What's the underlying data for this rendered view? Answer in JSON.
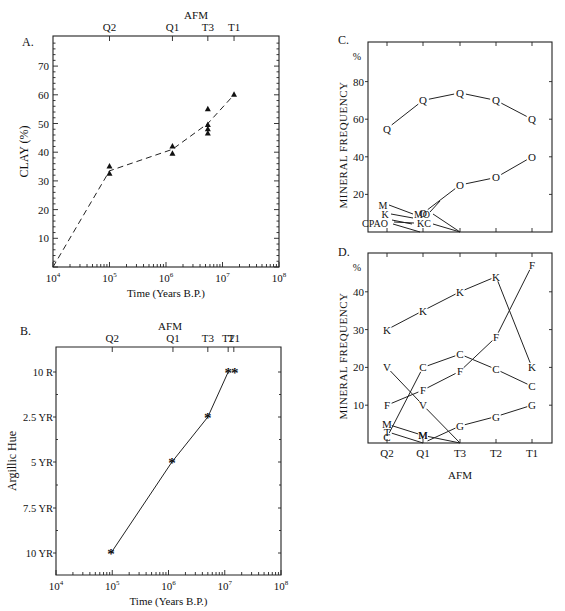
{
  "chart_data": [
    {
      "id": "A",
      "panel_label": "A.",
      "type": "scatter",
      "title": "",
      "top_axis_title": "AFM",
      "top_axis_ticks": [
        {
          "label": "Q2",
          "x": 100000
        },
        {
          "label": "Q1",
          "x": 1300000
        },
        {
          "label": "T3",
          "x": 5500000
        },
        {
          "label": "T1",
          "x": 16000000
        }
      ],
      "xlabel": "Time (Years B.P.)",
      "ylabel": "CLAY (%)",
      "xscale": "log",
      "xlim": [
        10000,
        100000000
      ],
      "ylim": [
        0,
        80
      ],
      "xticks": [
        "10^4",
        "10^5",
        "10^6",
        "10^7",
        "10^8"
      ],
      "yticks": [
        10,
        20,
        30,
        40,
        50,
        60,
        70
      ],
      "points_marker": "triangle",
      "points": [
        {
          "x": 100000,
          "y": 35
        },
        {
          "x": 100000,
          "y": 32.5
        },
        {
          "x": 1300000,
          "y": 42
        },
        {
          "x": 1300000,
          "y": 39.5
        },
        {
          "x": 5500000,
          "y": 55
        },
        {
          "x": 5500000,
          "y": 49.5
        },
        {
          "x": 5500000,
          "y": 48
        },
        {
          "x": 5500000,
          "y": 46.5
        },
        {
          "x": 16000000,
          "y": 60
        }
      ],
      "trend_line_style": "dashed",
      "trend_line": [
        {
          "x": 10000,
          "y": 0
        },
        {
          "x": 100000,
          "y": 33.5
        },
        {
          "x": 1300000,
          "y": 41
        },
        {
          "x": 5500000,
          "y": 50
        },
        {
          "x": 16000000,
          "y": 60
        }
      ]
    },
    {
      "id": "B",
      "panel_label": "B.",
      "type": "line",
      "title": "",
      "top_axis_title": "AFM",
      "top_axis_ticks": [
        {
          "label": "Q2",
          "x": 100000
        },
        {
          "label": "Q1",
          "x": 1200000
        },
        {
          "label": "T3",
          "x": 5000000
        },
        {
          "label": "T2",
          "x": 11500000
        },
        {
          "label": "T1",
          "x": 14500000
        }
      ],
      "xlabel": "Time (Years B.P.)",
      "ylabel": "Argillic Hue",
      "xscale": "log",
      "xlim": [
        10000,
        100000000
      ],
      "xticks": [
        "10^4",
        "10^5",
        "10^6",
        "10^7",
        "10^8"
      ],
      "ycategories": [
        "10 R",
        "2.5 YR",
        "5 YR",
        "7.5 YR",
        "10 YR"
      ],
      "points_marker": "asterisk",
      "points": [
        {
          "x": 95000,
          "hue_index": 4
        },
        {
          "x": 1150000,
          "hue_index": 2
        },
        {
          "x": 5000000,
          "hue_index": 1
        },
        {
          "x": 11500000,
          "hue_index": 0
        },
        {
          "x": 15000000,
          "hue_index": 0
        }
      ]
    },
    {
      "id": "C",
      "panel_label": "C.",
      "type": "line",
      "title": "",
      "categories": [
        "Q2",
        "Q1",
        "T3",
        "T2",
        "T1"
      ],
      "ylabel": "MINERAL FREQUENCY",
      "yunit": "%",
      "ylim": [
        0,
        100
      ],
      "yticks": [
        20,
        40,
        60,
        80
      ],
      "series": [
        {
          "name": "Q",
          "values": [
            55,
            70,
            74,
            70,
            60
          ]
        },
        {
          "name": "O",
          "values": [
            null,
            10,
            25,
            29,
            40
          ]
        }
      ],
      "minor_minerals_label_cluster": [
        "M",
        "K",
        "CPAO",
        "MO",
        "KC"
      ],
      "minor_minerals_note": "M, K, C, P, A, O near 0-12% at Q2/Q1, converging to 0 at T3"
    },
    {
      "id": "D",
      "panel_label": "D.",
      "type": "line",
      "title": "",
      "categories": [
        "Q2",
        "Q1",
        "T3",
        "T2",
        "T1"
      ],
      "xlabel": "AFM",
      "ylabel": "MINERAL FREQUENCY",
      "yunit": "%",
      "ylim": [
        0,
        48
      ],
      "yticks": [
        10,
        20,
        30,
        40
      ],
      "series": [
        {
          "name": "K",
          "values": [
            30,
            35,
            40,
            44,
            20
          ]
        },
        {
          "name": "F",
          "values": [
            10,
            14,
            19,
            28,
            47
          ]
        },
        {
          "name": "C",
          "values": [
            1.5,
            20,
            23.5,
            19.5,
            15
          ]
        },
        {
          "name": "V",
          "values": [
            20,
            10,
            0,
            null,
            null
          ]
        },
        {
          "name": "G",
          "values": [
            null,
            0,
            4.5,
            7,
            10
          ]
        },
        {
          "name": "M",
          "values": [
            5,
            2,
            0,
            null,
            null
          ]
        },
        {
          "name": "T",
          "values": [
            3,
            0,
            null,
            null,
            null
          ]
        }
      ]
    }
  ]
}
